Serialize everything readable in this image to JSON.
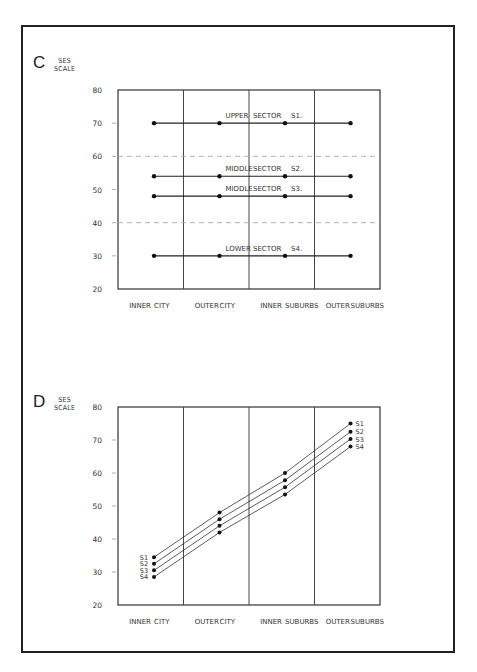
{
  "figure": {
    "panels": [
      {
        "letter": "C",
        "ylabel_line1": "SES",
        "ylabel_line2": "SCALE"
      },
      {
        "letter": "D",
        "ylabel_line1": "SES",
        "ylabel_line2": "SCALE"
      }
    ]
  },
  "chart_data": [
    {
      "type": "line",
      "panel": "C",
      "ylabel": "SES SCALE",
      "xlabel": "",
      "ylim": [
        20,
        80
      ],
      "yticks": [
        20,
        30,
        40,
        50,
        60,
        70,
        80
      ],
      "categories": [
        "INNER CITY",
        "OUTER CITY",
        "INNER SUBURBS",
        "OUTER SUBURBS"
      ],
      "dashed_reference_lines": [
        60,
        40
      ],
      "grid": false,
      "series": [
        {
          "name": "S1.",
          "label": "UPPER SECTOR S1.",
          "label_words": [
            "UPPER",
            "SECTOR",
            "S1."
          ],
          "values": [
            70,
            70,
            70,
            70
          ]
        },
        {
          "name": "S2.",
          "label": "MIDDLE SECTOR S2.",
          "label_words": [
            "MIDDLE",
            "SECTOR",
            "S2."
          ],
          "values": [
            54,
            54,
            54,
            54
          ]
        },
        {
          "name": "S3.",
          "label": "MIDDLE SECTOR S3.",
          "label_words": [
            "MIDDLE",
            "SECTOR",
            "S3."
          ],
          "values": [
            48,
            48,
            48,
            48
          ]
        },
        {
          "name": "S4.",
          "label": "LOWER SECTOR S4.",
          "label_words": [
            "LOWER",
            "SECTOR",
            "S4."
          ],
          "values": [
            30,
            30,
            30,
            30
          ]
        }
      ]
    },
    {
      "type": "line",
      "panel": "D",
      "ylabel": "SES SCALE",
      "xlabel": "",
      "ylim": [
        20,
        80
      ],
      "yticks": [
        20,
        30,
        40,
        50,
        60,
        70,
        80
      ],
      "categories": [
        "INNER CITY",
        "OUTER CITY",
        "INNER SUBURBS",
        "OUTER SUBURBS"
      ],
      "grid": false,
      "series": [
        {
          "name": "S1",
          "values": [
            34.5,
            48,
            60,
            75
          ]
        },
        {
          "name": "S2",
          "values": [
            32.5,
            46,
            57.8,
            72.5
          ]
        },
        {
          "name": "S3",
          "values": [
            30.5,
            44,
            55.7,
            70.3
          ]
        },
        {
          "name": "S4",
          "values": [
            28.5,
            42,
            53.5,
            68
          ]
        }
      ]
    }
  ]
}
